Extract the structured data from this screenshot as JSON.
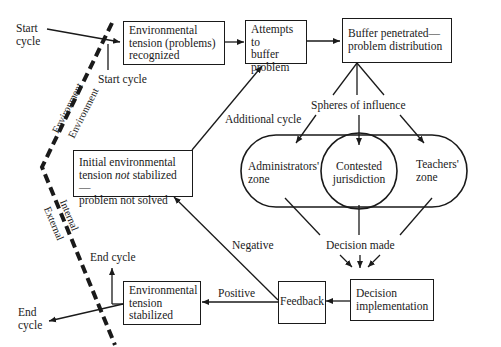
{
  "diagram": {
    "boxes": {
      "env_recognized": "Environmental tension (problems) recognized",
      "env_recognized_lines": [
        "Environmental",
        "tension (problems)",
        "recognized"
      ],
      "attempts_buffer_lines": [
        "Attempts to",
        "buffer",
        "problem"
      ],
      "buffer_penetrated_lines": [
        "Buffer penetrated—",
        "problem distribution"
      ],
      "initial_not_stabilized_lines": [
        "Initial environmental",
        "tension ",
        "not",
        " stabilized—",
        "problem not solved"
      ],
      "env_stabilized_lines": [
        "Environmental",
        "tension",
        "stabilized"
      ],
      "feedback": "Feedback",
      "decision_impl_lines": [
        "Decision",
        "implementation"
      ]
    },
    "zones": {
      "administrators_lines": [
        "Administrators'",
        "zone"
      ],
      "contested_lines": [
        "Contested",
        "jurisdiction"
      ],
      "teachers_lines": [
        "Teachers'",
        "zone"
      ]
    },
    "labels": {
      "start_cycle_outer_lines": [
        "Start",
        "cycle"
      ],
      "start_cycle_inner": "Start cycle",
      "spheres_of_influence": "Spheres of influence",
      "additional_cycle": "Additional cycle",
      "decision_made": "Decision made",
      "negative": "Negative",
      "positive": "Positive",
      "end_cycle_inner": "End cycle",
      "end_cycle_outer_lines": [
        "End",
        "cycle"
      ]
    },
    "boundary": {
      "environment_outer": "Environment",
      "environment_inner": "Environment",
      "internal": "Internal",
      "external": "External"
    },
    "colors": {
      "ink": "#1a1a1a",
      "background": "#ffffff"
    }
  }
}
